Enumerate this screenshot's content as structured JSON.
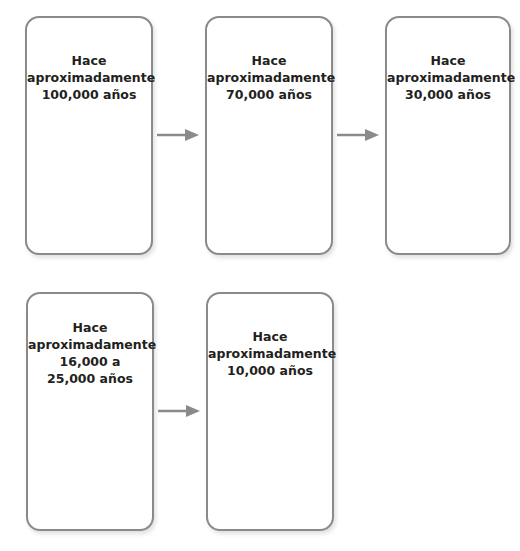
{
  "diagram": {
    "type": "timeline-flow",
    "colors": {
      "border": "#8a8a8a",
      "arrow": "#8a8a8a",
      "text": "#231f20"
    },
    "boxes": [
      {
        "id": 1,
        "label": "Hace\naproximadamente\n100,000 años"
      },
      {
        "id": 2,
        "label": "Hace\naproximadamente\n70,000 años"
      },
      {
        "id": 3,
        "label": "Hace\naproximadamente\n30,000 años"
      },
      {
        "id": 4,
        "label": "Hace\naproximadamente\n16,000 a\n25,000 años"
      },
      {
        "id": 5,
        "label": "Hace\naproximadamente\n10,000 años"
      }
    ],
    "arrows": [
      {
        "from": 1,
        "to": 2,
        "icon": "arrow-right-icon"
      },
      {
        "from": 2,
        "to": 3,
        "icon": "arrow-right-icon"
      },
      {
        "from": 4,
        "to": 5,
        "icon": "arrow-right-icon"
      }
    ]
  }
}
